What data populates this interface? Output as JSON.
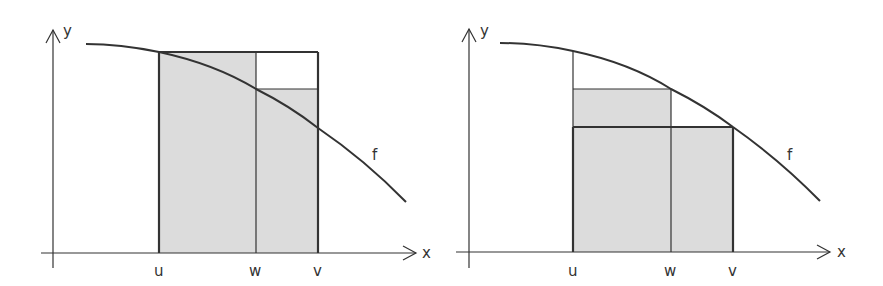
{
  "figure": {
    "colors": {
      "line": "#333333",
      "fill": "#dcdcdc",
      "background": "#ffffff"
    },
    "left_plot": {
      "x_axis_label": "x",
      "y_axis_label": "y",
      "curve_label": "f",
      "tick_labels": [
        "u",
        "w",
        "v"
      ]
    },
    "right_plot": {
      "x_axis_label": "x",
      "y_axis_label": "y",
      "curve_label": "f",
      "tick_labels": [
        "u",
        "w",
        "v"
      ]
    }
  }
}
